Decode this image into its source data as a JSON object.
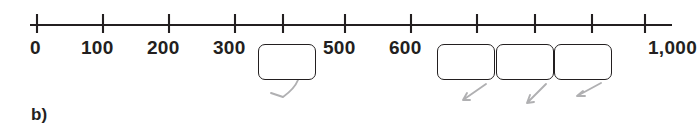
{
  "part": {
    "label": "b)"
  },
  "numberline": {
    "ticks": [
      {
        "value": "0",
        "x": 37,
        "label_x": 30,
        "label_y": 38
      },
      {
        "value": "100",
        "x": 103,
        "label_x": 81,
        "label_y": 38
      },
      {
        "value": "200",
        "x": 169,
        "label_x": 147,
        "label_y": 38
      },
      {
        "value": "300",
        "x": 235,
        "label_x": 213,
        "label_y": 38
      },
      {
        "value": "400",
        "x": 283,
        "label_x": 0,
        "label_y": 0
      },
      {
        "value": "500",
        "x": 345,
        "label_x": 323,
        "label_y": 38
      },
      {
        "value": "600",
        "x": 411,
        "label_x": 389,
        "label_y": 38
      },
      {
        "value": "700",
        "x": 477,
        "label_x": 0,
        "label_y": 0
      },
      {
        "value": "800",
        "x": 535,
        "label_x": 0,
        "label_y": 0
      },
      {
        "value": "900",
        "x": 592,
        "label_x": 0,
        "label_y": 0
      },
      {
        "value": "1,000",
        "x": 645,
        "label_x": 648,
        "label_y": 38
      }
    ],
    "visible_tick_labels": [
      "0",
      "100",
      "200",
      "300",
      "500",
      "600",
      "1,000"
    ],
    "axis_start_x": 30,
    "axis_end_x": 672,
    "axis_y": 25,
    "tick_top_y": 14,
    "tick_bottom_y": 33
  },
  "answer_boxes": [
    {
      "answer": "400",
      "x": 258,
      "y": 44,
      "w": 58,
      "h": 36
    },
    {
      "answer": "700",
      "x": 437,
      "y": 44,
      "w": 58,
      "h": 36
    },
    {
      "answer": "800",
      "x": 496,
      "y": 44,
      "w": 58,
      "h": 36
    },
    {
      "answer": "900",
      "x": 554,
      "y": 44,
      "w": 58,
      "h": 36
    }
  ],
  "colors": {
    "ink": "#231f20",
    "pencil": "#9a9a9c",
    "background": "#ffffff"
  }
}
